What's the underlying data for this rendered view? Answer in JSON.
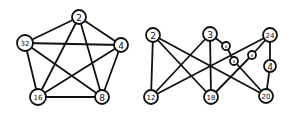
{
  "diagrams": [
    {
      "name": "left-graph",
      "nodes": [
        {
          "id": "n2",
          "label": "2",
          "x": 79,
          "y": 17,
          "r": 7
        },
        {
          "id": "n4",
          "label": "4",
          "x": 121,
          "y": 45,
          "r": 7
        },
        {
          "id": "n8",
          "label": "8",
          "x": 102,
          "y": 97,
          "r": 7
        },
        {
          "id": "n16",
          "label": "16",
          "x": 38,
          "y": 97,
          "r": 8
        },
        {
          "id": "n32",
          "label": "32",
          "x": 25,
          "y": 43,
          "r": 8
        }
      ],
      "edges": [
        [
          "n2",
          "n4"
        ],
        [
          "n2",
          "n8"
        ],
        [
          "n2",
          "n16"
        ],
        [
          "n2",
          "n32"
        ],
        [
          "n4",
          "n8"
        ],
        [
          "n4",
          "n16"
        ],
        [
          "n4",
          "n32"
        ],
        [
          "n8",
          "n16"
        ],
        [
          "n8",
          "n32"
        ],
        [
          "n16",
          "n32"
        ]
      ]
    },
    {
      "name": "right-graph",
      "nodes": [
        {
          "id": "r2",
          "label": "2",
          "x": 153,
          "y": 35,
          "r": 7
        },
        {
          "id": "r3",
          "label": "3",
          "x": 210,
          "y": 34,
          "r": 7
        },
        {
          "id": "r24",
          "label": "24",
          "x": 270,
          "y": 35,
          "r": 7
        },
        {
          "id": "r6a",
          "label": "6",
          "x": 226,
          "y": 46,
          "r": 4
        },
        {
          "id": "r6b",
          "label": "6",
          "x": 234,
          "y": 61,
          "r": 4
        },
        {
          "id": "r6c",
          "label": "6",
          "x": 252,
          "y": 55,
          "r": 4
        },
        {
          "id": "r4",
          "label": "4",
          "x": 270,
          "y": 66,
          "r": 6
        },
        {
          "id": "r12",
          "label": "12",
          "x": 151,
          "y": 97,
          "r": 7
        },
        {
          "id": "r18",
          "label": "18",
          "x": 211,
          "y": 97,
          "r": 7
        },
        {
          "id": "r20",
          "label": "20",
          "x": 266,
          "y": 96,
          "r": 7
        }
      ],
      "edges": [
        [
          "r2",
          "r12"
        ],
        [
          "r2",
          "r18"
        ],
        [
          "r2",
          "r20"
        ],
        [
          "r3",
          "r12"
        ],
        [
          "r3",
          "r18"
        ],
        [
          "r3",
          "r6a"
        ],
        [
          "r6a",
          "r6b"
        ],
        [
          "r6b",
          "r20"
        ],
        [
          "r24",
          "r12"
        ],
        [
          "r24",
          "r6c"
        ],
        [
          "r6c",
          "r18"
        ],
        [
          "r24",
          "r4"
        ],
        [
          "r4",
          "r20"
        ]
      ]
    }
  ]
}
